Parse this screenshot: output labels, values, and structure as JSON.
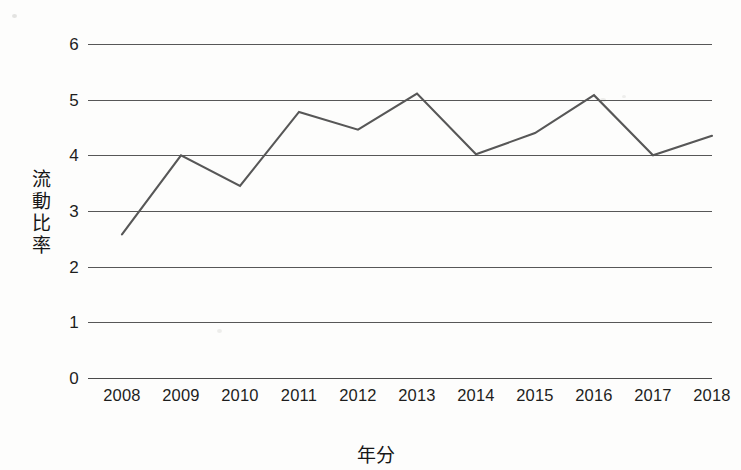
{
  "chart_data": {
    "type": "line",
    "title": "",
    "xlabel": "年分",
    "ylabel": "流動比率",
    "ylabel_chars": [
      "流",
      "動",
      "比",
      "率"
    ],
    "categories": [
      "2008",
      "2009",
      "2010",
      "2011",
      "2012",
      "2013",
      "2014",
      "2015",
      "2016",
      "2017",
      "2018"
    ],
    "values": [
      2.58,
      4.0,
      3.45,
      4.78,
      4.46,
      5.11,
      4.02,
      4.4,
      5.08,
      4.0,
      4.35
    ],
    "series": [
      {
        "name": "流動比率",
        "values": [
          2.58,
          4.0,
          3.45,
          4.78,
          4.46,
          5.11,
          4.02,
          4.4,
          5.08,
          4.0,
          4.35
        ]
      }
    ],
    "ylim": [
      0,
      6
    ],
    "yticks": [
      "0",
      "1",
      "2",
      "3",
      "4",
      "5",
      "6"
    ],
    "ytick_values": [
      0,
      1,
      2,
      3,
      4,
      5,
      6
    ],
    "xlim": [
      "2008",
      "2018"
    ],
    "grid": "horizontal",
    "legend": "none",
    "line_color": "#575757",
    "text_color": "#1d1d1d",
    "background_color": "#fdfdfc"
  }
}
